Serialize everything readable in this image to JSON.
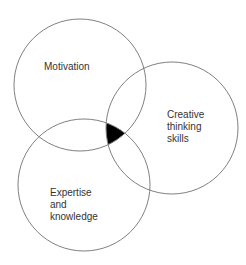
{
  "diagram": {
    "type": "venn",
    "title": "",
    "background_color": "#ffffff",
    "canvas": {
      "width": 246,
      "height": 265
    },
    "stroke_color": "#808080",
    "stroke_width": 1,
    "label_color": "#333333",
    "label_font_size": 10,
    "intersection": {
      "name": "triple-intersection",
      "label": "",
      "fill_color": "#000000",
      "description": "all three sets overlap"
    },
    "sets": [
      {
        "id": "motivation",
        "label": "Motivation",
        "lines": [
          "Motivation"
        ],
        "cx": 80,
        "cy": 85,
        "r": 66,
        "label_x": 44,
        "label_y": 70,
        "text_anchor": "start"
      },
      {
        "id": "creative-thinking-skills",
        "label": "Creative thinking skills",
        "lines": [
          "Creative",
          "thinking",
          "skills"
        ],
        "cx": 172,
        "cy": 128,
        "r": 66,
        "label_x": 167,
        "label_y": 118,
        "text_anchor": "start"
      },
      {
        "id": "expertise-and-knowledge",
        "label": "Expertise and knowledge",
        "lines": [
          "Expertise",
          "and",
          "knowledge"
        ],
        "cx": 84,
        "cy": 185,
        "r": 66,
        "label_x": 50,
        "label_y": 196,
        "text_anchor": "start"
      }
    ]
  }
}
